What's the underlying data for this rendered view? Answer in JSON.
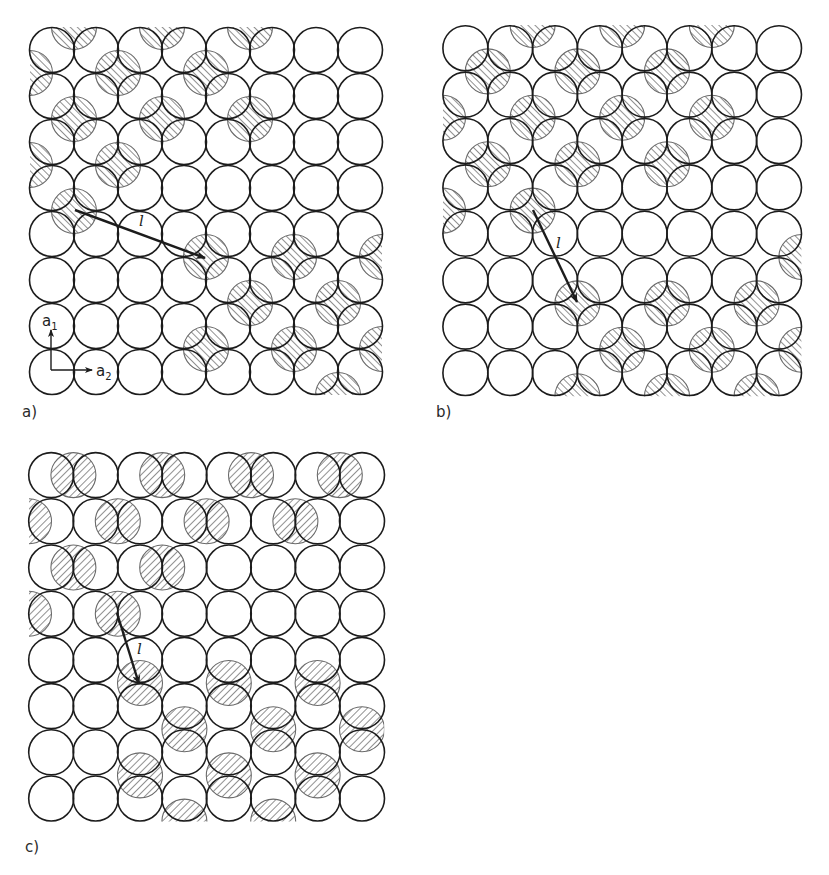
{
  "figure": {
    "ink_color": "#1c1c1c",
    "hatch_color": "#555555",
    "background": "#ffffff",
    "circle_radius": 22.5
  },
  "panels": [
    {
      "id": "a",
      "label": "a)",
      "label_pos": [
        22,
        405
      ],
      "grid": {
        "origin": [
          30,
          27
        ],
        "cols": 8,
        "rows": 8,
        "pitch_x": 44,
        "pitch_y": 46
      },
      "shift_type": "corner",
      "hatch_dir": "/",
      "shaded_centers": [
        [
          1,
          0
        ],
        [
          3,
          0
        ],
        [
          5,
          0
        ],
        [
          0,
          1
        ],
        [
          2,
          1
        ],
        [
          4,
          1
        ],
        [
          1,
          2
        ],
        [
          3,
          2
        ],
        [
          5,
          2
        ],
        [
          0,
          3
        ],
        [
          2,
          3
        ],
        [
          1,
          4
        ],
        [
          4,
          5
        ],
        [
          6,
          5
        ],
        [
          8,
          5
        ],
        [
          5,
          6
        ],
        [
          7,
          6
        ],
        [
          4,
          7
        ],
        [
          6,
          7
        ],
        [
          8,
          7
        ],
        [
          7,
          8
        ]
      ],
      "arrow": {
        "from": [
          75,
          210
        ],
        "to": [
          205,
          258
        ],
        "label": "l",
        "label_pos": [
          139,
          214
        ]
      },
      "basis_vectors": {
        "origin": [
          51,
          370
        ],
        "a1": {
          "to": [
            51,
            330
          ],
          "label": "a",
          "sub": "1",
          "label_pos": [
            42,
            314
          ]
        },
        "a2": {
          "to": [
            92,
            370
          ],
          "label": "a",
          "sub": "2",
          "label_pos": [
            96,
            364
          ]
        }
      }
    },
    {
      "id": "b",
      "label": "b)",
      "label_pos": [
        436,
        405
      ],
      "grid": {
        "origin": [
          443,
          25
        ],
        "cols": 8,
        "rows": 8,
        "pitch_x": 44.8,
        "pitch_y": 46.4
      },
      "shift_type": "corner",
      "hatch_dir": "/",
      "shaded_centers": [
        [
          2,
          0
        ],
        [
          4,
          0
        ],
        [
          6,
          0
        ],
        [
          1,
          1
        ],
        [
          3,
          1
        ],
        [
          5,
          1
        ],
        [
          0,
          2
        ],
        [
          2,
          2
        ],
        [
          4,
          2
        ],
        [
          6,
          2
        ],
        [
          1,
          3
        ],
        [
          3,
          3
        ],
        [
          5,
          3
        ],
        [
          0,
          4
        ],
        [
          2,
          4
        ],
        [
          8,
          5
        ],
        [
          3,
          6
        ],
        [
          5,
          6
        ],
        [
          7,
          6
        ],
        [
          4,
          7
        ],
        [
          6,
          7
        ],
        [
          8,
          7
        ],
        [
          3,
          8
        ],
        [
          5,
          8
        ],
        [
          7,
          8
        ]
      ],
      "arrow": {
        "from": [
          533,
          210
        ],
        "to": [
          577,
          302
        ],
        "label": "l",
        "label_pos": [
          556,
          236
        ]
      }
    },
    {
      "id": "c",
      "label": "c)",
      "label_pos": [
        25,
        840
      ],
      "grid": {
        "origin": [
          29,
          452
        ],
        "cols": 8,
        "rows": 8,
        "pitch_x": 44.4,
        "pitch_y": 46.2
      },
      "hatch_dir": "\\",
      "shaded_groups": [
        {
          "shift_type": "horizontal-edge",
          "centers": [
            [
              1,
              0
            ],
            [
              3,
              0
            ],
            [
              5,
              0
            ],
            [
              7,
              0
            ],
            [
              0,
              1
            ],
            [
              2,
              1
            ],
            [
              4,
              1
            ],
            [
              6,
              1
            ],
            [
              1,
              2
            ],
            [
              3,
              2
            ],
            [
              0,
              3
            ],
            [
              2,
              3
            ]
          ]
        },
        {
          "shift_type": "vertical-edge",
          "centers": [
            [
              2,
              5
            ],
            [
              4,
              5
            ],
            [
              6,
              5
            ],
            [
              3,
              6
            ],
            [
              5,
              6
            ],
            [
              7,
              6
            ],
            [
              2,
              7
            ],
            [
              4,
              7
            ],
            [
              6,
              7
            ],
            [
              3,
              8
            ],
            [
              5,
              8
            ]
          ]
        }
      ],
      "arrow": {
        "from": [
          117,
          613
        ],
        "to": [
          139,
          684
        ],
        "label": "l",
        "label_pos": [
          137,
          642
        ]
      }
    }
  ]
}
